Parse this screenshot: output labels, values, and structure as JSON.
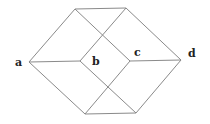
{
  "diagram": {
    "type": "graph",
    "colors": {
      "edge": "#8a8a8a",
      "label": "#222222",
      "background": "#ffffff"
    },
    "nodes": [
      {
        "id": "a",
        "label": "a",
        "x": 29,
        "y": 62,
        "label_x": 15,
        "label_y": 66
      },
      {
        "id": "TL",
        "label": "",
        "x": 75,
        "y": 9
      },
      {
        "id": "TR",
        "label": "",
        "x": 126,
        "y": 8
      },
      {
        "id": "b",
        "label": "b",
        "x": 80,
        "y": 61,
        "label_x": 92,
        "label_y": 65
      },
      {
        "id": "c",
        "label": "c",
        "x": 130,
        "y": 61,
        "label_x": 134,
        "label_y": 56
      },
      {
        "id": "d",
        "label": "d",
        "x": 181,
        "y": 60,
        "label_x": 188,
        "label_y": 57
      },
      {
        "id": "BL",
        "label": "",
        "x": 85,
        "y": 114
      },
      {
        "id": "BR",
        "label": "",
        "x": 136,
        "y": 113
      }
    ],
    "edges": [
      [
        "a",
        "TL"
      ],
      [
        "TL",
        "TR"
      ],
      [
        "TR",
        "d"
      ],
      [
        "a",
        "BL"
      ],
      [
        "BL",
        "BR"
      ],
      [
        "BR",
        "d"
      ],
      [
        "a",
        "b"
      ],
      [
        "c",
        "d"
      ],
      [
        "TL",
        "c"
      ],
      [
        "TR",
        "b"
      ],
      [
        "b",
        "BR"
      ],
      [
        "c",
        "BL"
      ]
    ]
  }
}
